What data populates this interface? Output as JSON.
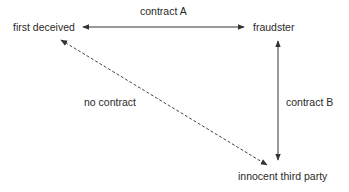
{
  "nodes": {
    "first_deceived": "first deceived",
    "fraudster": "fraudster",
    "innocent_third_party": "innocent third party"
  },
  "edges": {
    "contract_a": "contract A",
    "contract_b": "contract B",
    "no_contract": "no contract"
  },
  "colors": {
    "line": "#333333",
    "text": "#2a2a2a"
  }
}
